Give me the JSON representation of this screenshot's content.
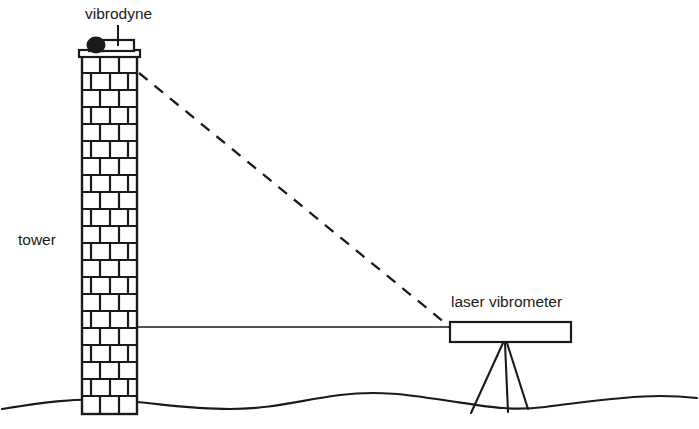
{
  "diagram": {
    "labels": {
      "vibrodyne": "vibrodyne",
      "tower": "tower",
      "laser_vibrometer": "laser vibrometer"
    },
    "colors": {
      "stroke": "#1a1a1a",
      "background": "#ffffff",
      "brick_fill": "#ffffff",
      "device_fill": "#ffffff",
      "vibrodyne_motor_fill": "#1a1a1a"
    },
    "elements": {
      "tower": {
        "name": "masonry tower",
        "x": 82,
        "y": 56,
        "width": 55,
        "height": 358,
        "brick_rows": 21,
        "bond": "running-bond"
      },
      "vibrodyne": {
        "name": "vibrodyne shaker",
        "x": 84,
        "y": 38,
        "width": 50,
        "height": 18
      },
      "laser_vibrometer": {
        "name": "laser vibrometer",
        "x": 450,
        "y": 322,
        "width": 121,
        "height": 20,
        "tripod_legs": 3
      },
      "laser_beam": {
        "name": "laser beam",
        "style": "dashed",
        "from_x": 139,
        "from_y": 73,
        "to_x": 450,
        "to_y": 326
      },
      "reference_line": {
        "name": "horizontal reference line",
        "style": "solid",
        "from_x": 137,
        "from_y": 326,
        "to_x": 450,
        "to_y": 326
      },
      "ground_line": {
        "name": "undulating ground surface",
        "style": "wavy"
      }
    }
  }
}
